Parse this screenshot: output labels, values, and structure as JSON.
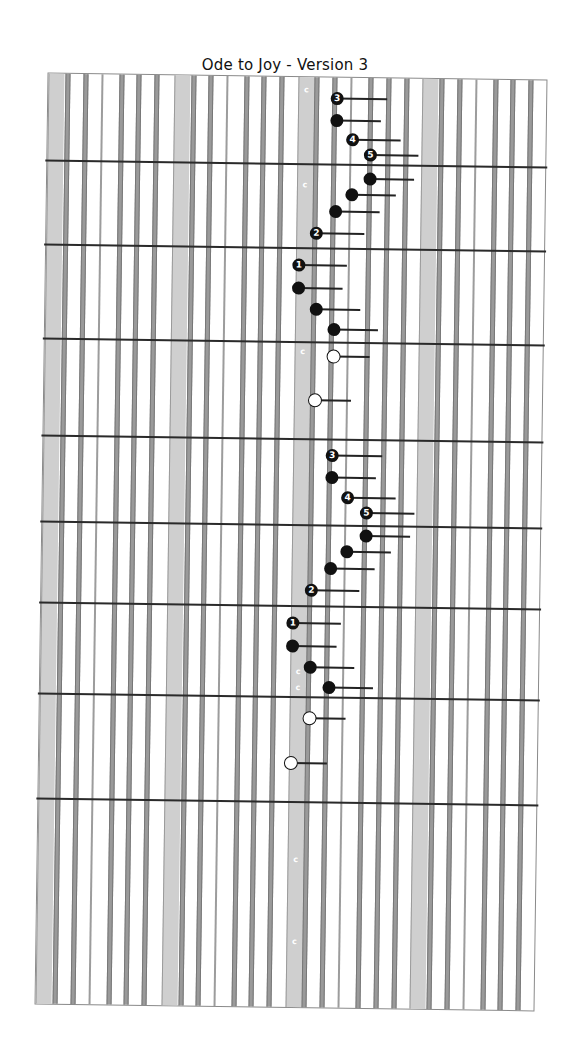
{
  "title": "Ode to Joy - Version 3",
  "sheet": {
    "bands": [
      0,
      126,
      250,
      374
    ],
    "band_width": 15,
    "strings": [
      {
        "x": 17,
        "type": "wide"
      },
      {
        "x": 35,
        "type": "wide"
      },
      {
        "x": 53,
        "type": "thin"
      },
      {
        "x": 71,
        "type": "wide"
      },
      {
        "x": 88,
        "type": "wide"
      },
      {
        "x": 106,
        "type": "wide"
      },
      {
        "x": 143,
        "type": "wide"
      },
      {
        "x": 160,
        "type": "wide"
      },
      {
        "x": 178,
        "type": "thin"
      },
      {
        "x": 196,
        "type": "wide"
      },
      {
        "x": 213,
        "type": "wide"
      },
      {
        "x": 231,
        "type": "wide"
      },
      {
        "x": 266,
        "type": "wide"
      },
      {
        "x": 284,
        "type": "wide"
      },
      {
        "x": 302,
        "type": "thin"
      },
      {
        "x": 320,
        "type": "wide"
      },
      {
        "x": 338,
        "type": "wide"
      },
      {
        "x": 356,
        "type": "wide"
      },
      {
        "x": 391,
        "type": "wide"
      },
      {
        "x": 409,
        "type": "wide"
      },
      {
        "x": 427,
        "type": "thin"
      },
      {
        "x": 445,
        "type": "wide"
      },
      {
        "x": 462,
        "type": "wide"
      },
      {
        "x": 480,
        "type": "wide"
      }
    ],
    "measures_y": [
      86,
      170,
      264,
      361,
      447,
      528,
      619,
      724
    ],
    "c_marks_y": [
      10,
      105,
      272,
      592,
      608,
      780,
      862
    ],
    "c_mark_label": "c"
  },
  "notes": [
    {
      "x": 289,
      "y": 21,
      "type": "filled",
      "label": "3",
      "tail": 50
    },
    {
      "x": 289,
      "y": 43,
      "type": "filled",
      "label": "",
      "tail": 44
    },
    {
      "x": 305,
      "y": 62,
      "type": "filled",
      "label": "4",
      "tail": 48
    },
    {
      "x": 323,
      "y": 77,
      "type": "filled",
      "label": "5",
      "tail": 48
    },
    {
      "x": 323,
      "y": 101,
      "type": "filled",
      "label": "",
      "tail": 44
    },
    {
      "x": 305,
      "y": 117,
      "type": "filled",
      "label": "",
      "tail": 44
    },
    {
      "x": 289,
      "y": 134,
      "type": "filled",
      "label": "",
      "tail": 44
    },
    {
      "x": 270,
      "y": 156,
      "type": "filled",
      "label": "2",
      "tail": 48
    },
    {
      "x": 253,
      "y": 188,
      "type": "filled",
      "label": "1",
      "tail": 48
    },
    {
      "x": 253,
      "y": 211,
      "type": "filled",
      "label": "",
      "tail": 44
    },
    {
      "x": 271,
      "y": 232,
      "type": "filled",
      "label": "",
      "tail": 44
    },
    {
      "x": 289,
      "y": 252,
      "type": "filled",
      "label": "",
      "tail": 44
    },
    {
      "x": 289,
      "y": 279,
      "type": "open",
      "label": "",
      "tail": 36
    },
    {
      "x": 271,
      "y": 323,
      "type": "open",
      "label": "",
      "tail": 36
    },
    {
      "x": 289,
      "y": 378,
      "type": "filled",
      "label": "3",
      "tail": 50
    },
    {
      "x": 289,
      "y": 400,
      "type": "filled",
      "label": "",
      "tail": 44
    },
    {
      "x": 305,
      "y": 420,
      "type": "filled",
      "label": "4",
      "tail": 48
    },
    {
      "x": 324,
      "y": 435,
      "type": "filled",
      "label": "5",
      "tail": 48
    },
    {
      "x": 324,
      "y": 458,
      "type": "filled",
      "label": "",
      "tail": 44
    },
    {
      "x": 305,
      "y": 474,
      "type": "filled",
      "label": "",
      "tail": 44
    },
    {
      "x": 289,
      "y": 491,
      "type": "filled",
      "label": "",
      "tail": 44
    },
    {
      "x": 270,
      "y": 513,
      "type": "filled",
      "label": "2",
      "tail": 48
    },
    {
      "x": 252,
      "y": 546,
      "type": "filled",
      "label": "1",
      "tail": 48
    },
    {
      "x": 252,
      "y": 569,
      "type": "filled",
      "label": "",
      "tail": 44
    },
    {
      "x": 270,
      "y": 590,
      "type": "filled",
      "label": "",
      "tail": 44
    },
    {
      "x": 289,
      "y": 610,
      "type": "filled",
      "label": "",
      "tail": 44
    },
    {
      "x": 270,
      "y": 641,
      "type": "open",
      "label": "",
      "tail": 36
    },
    {
      "x": 252,
      "y": 686,
      "type": "open",
      "label": "",
      "tail": 36
    }
  ]
}
